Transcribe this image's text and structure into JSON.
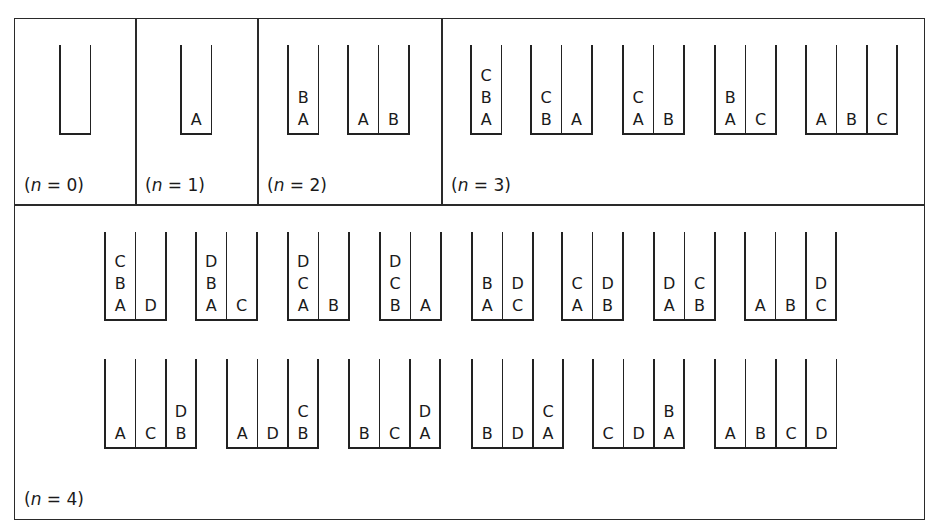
{
  "figure": {
    "panels": [
      {
        "id": "n0",
        "label_var": "n",
        "label_eq": " = 0",
        "configurations": [
          {
            "x": 60,
            "top": 45,
            "bottom": 135,
            "columns": [
              []
            ]
          }
        ]
      },
      {
        "id": "n1",
        "label_var": "n",
        "label_eq": " = 1",
        "configurations": [
          {
            "x": 181,
            "top": 45,
            "bottom": 135,
            "columns": [
              [
                "A"
              ]
            ]
          }
        ]
      },
      {
        "id": "n2",
        "label_var": "n",
        "label_eq": " = 2",
        "configurations": [
          {
            "x": 288,
            "top": 45,
            "bottom": 135,
            "columns": [
              [
                "A",
                "B"
              ]
            ]
          },
          {
            "x": 348,
            "top": 45,
            "bottom": 135,
            "columns": [
              [
                "A"
              ],
              [
                "B"
              ]
            ]
          }
        ]
      },
      {
        "id": "n3",
        "label_var": "n",
        "label_eq": " = 3",
        "configurations": [
          {
            "x": 471,
            "top": 45,
            "bottom": 135,
            "columns": [
              [
                "A",
                "B",
                "C"
              ]
            ]
          },
          {
            "x": 531,
            "top": 45,
            "bottom": 135,
            "columns": [
              [
                "B",
                "C"
              ],
              [
                "A"
              ]
            ]
          },
          {
            "x": 623,
            "top": 45,
            "bottom": 135,
            "columns": [
              [
                "A",
                "C"
              ],
              [
                "B"
              ]
            ]
          },
          {
            "x": 715,
            "top": 45,
            "bottom": 135,
            "columns": [
              [
                "A",
                "B"
              ],
              [
                "C"
              ]
            ]
          },
          {
            "x": 806,
            "top": 45,
            "bottom": 135,
            "columns": [
              [
                "A"
              ],
              [
                "B"
              ],
              [
                "C"
              ]
            ]
          }
        ]
      },
      {
        "id": "n4",
        "label_var": "n",
        "label_eq": " = 4",
        "configurations": [
          {
            "x": 105,
            "top": 232,
            "bottom": 321,
            "columns": [
              [
                "A",
                "B",
                "C"
              ],
              [
                "D"
              ]
            ]
          },
          {
            "x": 196,
            "top": 232,
            "bottom": 321,
            "columns": [
              [
                "A",
                "B",
                "D"
              ],
              [
                "C"
              ]
            ]
          },
          {
            "x": 288,
            "top": 232,
            "bottom": 321,
            "columns": [
              [
                "A",
                "C",
                "D"
              ],
              [
                "B"
              ]
            ]
          },
          {
            "x": 380,
            "top": 232,
            "bottom": 321,
            "columns": [
              [
                "B",
                "C",
                "D"
              ],
              [
                "A"
              ]
            ]
          },
          {
            "x": 472,
            "top": 232,
            "bottom": 321,
            "columns": [
              [
                "A",
                "B"
              ],
              [
                "C",
                "D"
              ]
            ]
          },
          {
            "x": 562,
            "top": 232,
            "bottom": 321,
            "columns": [
              [
                "A",
                "C"
              ],
              [
                "B",
                "D"
              ]
            ]
          },
          {
            "x": 654,
            "top": 232,
            "bottom": 321,
            "columns": [
              [
                "A",
                "D"
              ],
              [
                "B",
                "C"
              ]
            ]
          },
          {
            "x": 745,
            "top": 232,
            "bottom": 321,
            "columns": [
              [
                "A"
              ],
              [
                "B"
              ],
              [
                "C",
                "D"
              ]
            ]
          },
          {
            "x": 105,
            "top": 359,
            "bottom": 449,
            "columns": [
              [
                "A"
              ],
              [
                "C"
              ],
              [
                "B",
                "D"
              ]
            ]
          },
          {
            "x": 227,
            "top": 359,
            "bottom": 449,
            "columns": [
              [
                "A"
              ],
              [
                "D"
              ],
              [
                "B",
                "C"
              ]
            ]
          },
          {
            "x": 349,
            "top": 359,
            "bottom": 449,
            "columns": [
              [
                "B"
              ],
              [
                "C"
              ],
              [
                "A",
                "D"
              ]
            ]
          },
          {
            "x": 472,
            "top": 359,
            "bottom": 449,
            "columns": [
              [
                "B"
              ],
              [
                "D"
              ],
              [
                "A",
                "C"
              ]
            ]
          },
          {
            "x": 593,
            "top": 359,
            "bottom": 449,
            "columns": [
              [
                "C"
              ],
              [
                "D"
              ],
              [
                "A",
                "B"
              ]
            ]
          },
          {
            "x": 715,
            "top": 359,
            "bottom": 449,
            "columns": [
              [
                "A"
              ],
              [
                "B"
              ],
              [
                "C"
              ],
              [
                "D"
              ]
            ]
          }
        ]
      }
    ],
    "labels": [
      {
        "panel": "n0",
        "x": 24,
        "y": 175
      },
      {
        "panel": "n1",
        "x": 145,
        "y": 175
      },
      {
        "panel": "n2",
        "x": 267,
        "y": 175
      },
      {
        "panel": "n3",
        "x": 451,
        "y": 175
      },
      {
        "panel": "n4",
        "x": 24,
        "y": 489
      }
    ],
    "colors": {
      "line": "#222222",
      "text": "#1a1a1a",
      "background": "#ffffff"
    }
  }
}
